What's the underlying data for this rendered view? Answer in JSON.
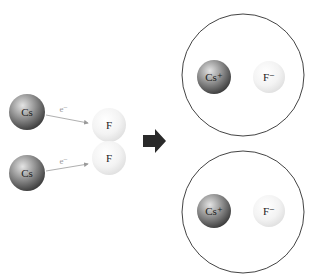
{
  "diagram": {
    "title": "",
    "left": {
      "atoms": [
        {
          "label": "Cs",
          "role": "cesium-atom"
        },
        {
          "label": "Cs",
          "role": "cesium-atom"
        },
        {
          "label": "F",
          "role": "fluorine-atom"
        },
        {
          "label": "F",
          "role": "fluorine-atom"
        }
      ],
      "electron_transfers": [
        {
          "label": "e⁻",
          "from": "Cs",
          "to": "F"
        },
        {
          "label": "e⁻",
          "from": "Cs",
          "to": "F"
        }
      ]
    },
    "arrow_icon": "right-arrow-icon",
    "right": {
      "ion_pairs": [
        {
          "cation": "Cs⁺",
          "anion": "F⁻"
        },
        {
          "cation": "Cs⁺",
          "anion": "F⁻"
        }
      ]
    },
    "colors": {
      "cesium_dark": "#4a4a4a",
      "cesium_light": "#cfcfcf",
      "fluorine_light": "#f8f8f8",
      "fluorine_edge": "#dcdcdc",
      "arrow": "#2a2a2a",
      "electron_arrow": "#9a9a9a",
      "circle_stroke": "#444444"
    }
  }
}
